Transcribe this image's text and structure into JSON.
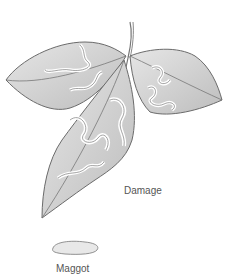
{
  "illustration": {
    "subject": "leaf miner damage on three-leaflet leaf with maggot",
    "labels": {
      "damage": "Damage",
      "maggot": "Maggot"
    },
    "colors": {
      "leaf_fill": "#d9d9d9",
      "leaf_shade": "#bdbdbd",
      "outline": "#6b6b6b",
      "mine_trail": "#ffffff",
      "label_text": "#555555"
    },
    "icons": [
      "leaf-illustration",
      "stem-illustration",
      "maggot-illustration"
    ]
  }
}
